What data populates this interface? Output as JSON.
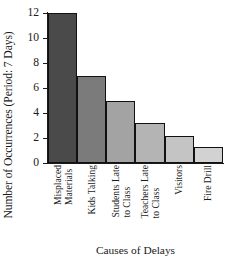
{
  "chart_data": {
    "type": "bar",
    "title": "",
    "xlabel": "Causes of Delays",
    "ylabel": "Number of Occurrences (Period: 7 Days)",
    "categories": [
      "Misplaced Materials",
      "Kids Talking",
      "Students Late to Class",
      "Teachers Late to Class",
      "Visitors",
      "Fire Drill"
    ],
    "category_lines": [
      [
        "Misplaced",
        "Materials"
      ],
      [
        "Kids Talking",
        ""
      ],
      [
        "Students Late",
        "to Class"
      ],
      [
        "Teachers Late",
        "to Class"
      ],
      [
        "Visitors",
        ""
      ],
      [
        "Fire Drill",
        ""
      ]
    ],
    "values": [
      12,
      7,
      5,
      3.2,
      2.2,
      1.3
    ],
    "ylim": [
      0,
      12
    ],
    "yticks": [
      0,
      2,
      4,
      6,
      8,
      10,
      12
    ],
    "ytick_labels": [
      "0",
      "2",
      "4",
      "6",
      "8",
      "10",
      "12"
    ],
    "grid": false,
    "legend": "none",
    "bar_colors": [
      "#4a4a4a",
      "#7b7b7b",
      "#a3a3a3",
      "#b4b4b4",
      "#c4c4c4",
      "#d2d2d2"
    ],
    "bar_border_color": "#111111",
    "axis_color": "#1a1a1a"
  }
}
